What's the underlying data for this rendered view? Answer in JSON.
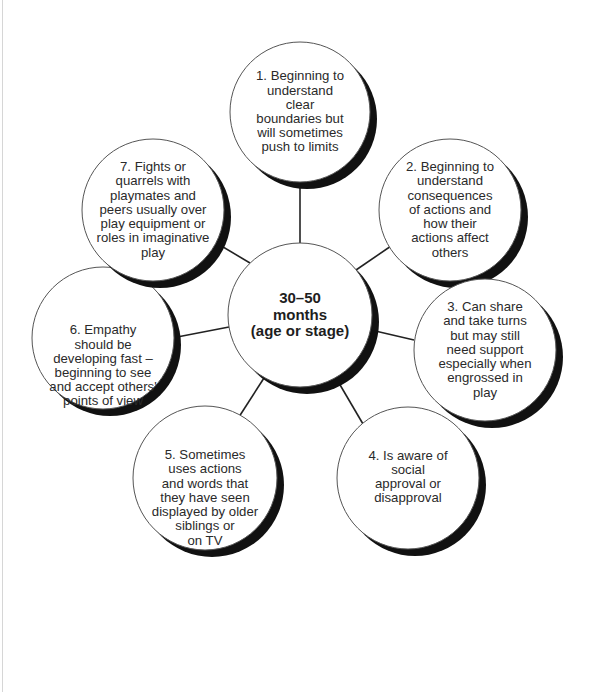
{
  "diagram": {
    "center": {
      "lines": [
        "30–50",
        "months",
        "(age or stage)"
      ]
    },
    "nodes": [
      {
        "number": 1,
        "lines": [
          "1. Beginning to",
          "understand",
          "clear",
          "boundaries but",
          "will sometimes",
          "push to limits"
        ]
      },
      {
        "number": 2,
        "lines": [
          "2. Beginning to",
          "understand",
          "consequences",
          "of actions and",
          "how their",
          "actions affect",
          "others"
        ]
      },
      {
        "number": 3,
        "lines": [
          "3. Can share",
          "and take turns",
          "but may still",
          "need support",
          "especially when",
          "engrossed in",
          "play"
        ]
      },
      {
        "number": 4,
        "lines": [
          "4. Is aware of",
          "social",
          "approval or",
          "disapproval"
        ]
      },
      {
        "number": 5,
        "lines": [
          "5. Sometimes",
          "uses actions",
          "and words that",
          "they have seen",
          "displayed by older",
          "siblings or",
          "on TV"
        ]
      },
      {
        "number": 6,
        "lines": [
          "6. Empathy",
          "should be",
          "developing fast –",
          "beginning to see",
          "and accept others'",
          "points of view"
        ]
      },
      {
        "number": 7,
        "lines": [
          "7. Fights or",
          "quarrels with",
          "playmates and",
          "peers usually over",
          "play equipment or",
          "roles in imaginative",
          "play"
        ]
      }
    ],
    "colors": {
      "outline": "#555555",
      "shadow": "#111111",
      "connector": "#222222",
      "fill": "#ffffff"
    }
  }
}
